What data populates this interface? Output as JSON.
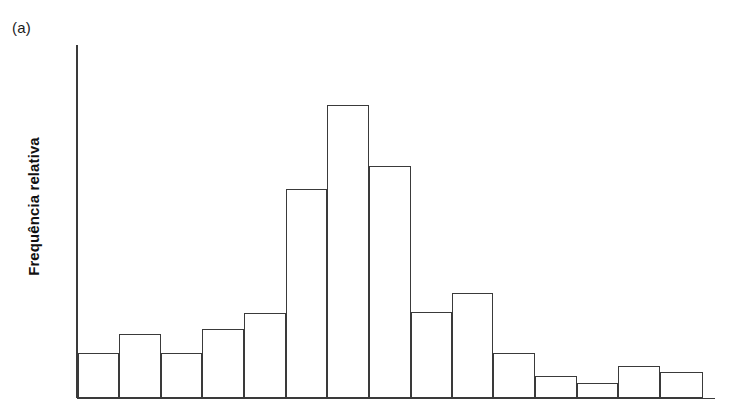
{
  "figure": {
    "panel_label": "(a)",
    "ylabel": "Frequência relativa",
    "background_color": "#ffffff",
    "line_color": "#3a3a3a"
  },
  "chart_data": {
    "type": "bar",
    "title": "",
    "subtitle": "",
    "xlabel": "",
    "ylabel": "Frequência relativa",
    "grid": false,
    "legend": null,
    "axes": {
      "y_axis_visible": true,
      "x_axis_visible": true,
      "y_tick_labels": [],
      "x_tick_labels": [],
      "ylim": [
        0,
        1.0
      ],
      "xlim": [
        0,
        15
      ]
    },
    "note": "Histogram of relative frequency; bars are contiguous, unlabeled axes. Values are relative bar heights read off the pixel plot (baseline = 0, tallest bar = 1.00).",
    "categories": [
      "1",
      "2",
      "3",
      "4",
      "5",
      "6",
      "7",
      "8",
      "9",
      "10",
      "11",
      "12",
      "13",
      "14",
      "15"
    ],
    "values": [
      0.154,
      0.218,
      0.154,
      0.235,
      0.29,
      0.713,
      1.0,
      0.792,
      0.293,
      0.358,
      0.154,
      0.075,
      0.051,
      0.109,
      0.089
    ],
    "bar_pixel_tops": [
      353,
      334,
      353,
      329,
      313,
      189,
      105,
      166,
      312,
      293,
      353,
      376,
      383,
      366,
      372
    ],
    "bar_pixel_edges": [
      78,
      119,
      161,
      202,
      244,
      286,
      327,
      369,
      411,
      452,
      493,
      535,
      577,
      618,
      660,
      703
    ],
    "baseline_y": 398,
    "y_axis_top": 45,
    "y_axis_x": 77
  }
}
